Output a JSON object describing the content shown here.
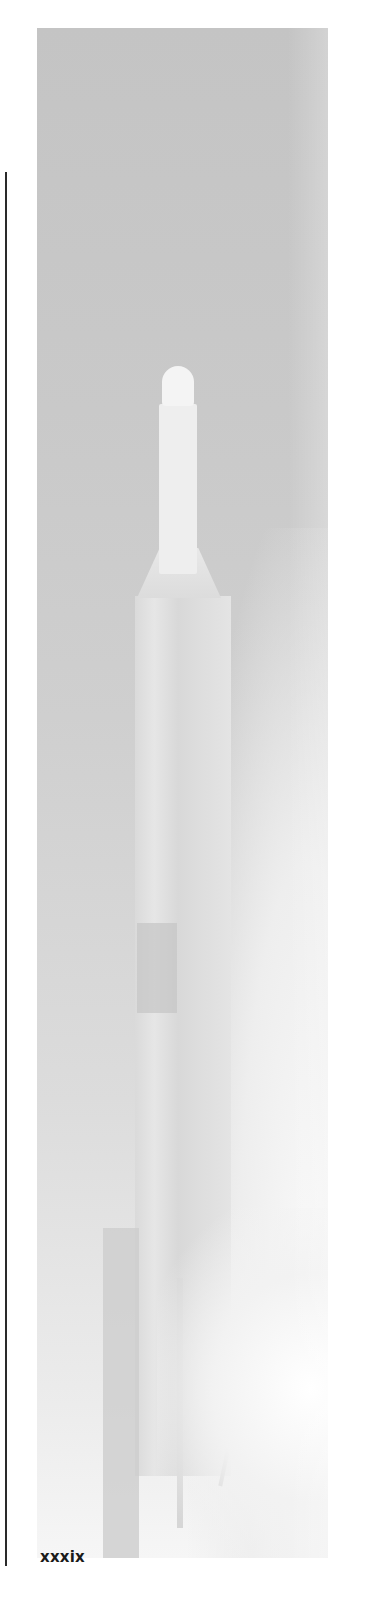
{
  "page": {
    "number": "xxxix"
  },
  "figure": {
    "style": "grayscale",
    "caption": ""
  },
  "colors": {
    "background": "#ffffff",
    "rule": "#2a2a2a",
    "text": "#1a1a1a"
  }
}
